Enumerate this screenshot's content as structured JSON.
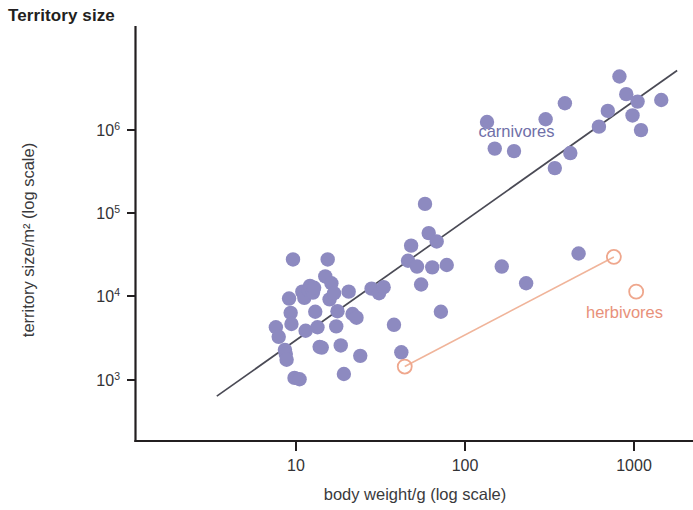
{
  "chart": {
    "title": "Territory size"
  },
  "chart_data": {
    "type": "scatter",
    "title": "Territory size",
    "xlabel": "body weight/g (log scale)",
    "ylabel": "territory size/m² (log scale)",
    "xscale": "log",
    "yscale": "log",
    "grid": false,
    "legend_position": "inline-annotations",
    "xlim": [
      2.6,
      2200
    ],
    "ylim": [
      450,
      7000000
    ],
    "xticks": [
      10,
      100,
      1000
    ],
    "xtick_labels": [
      "10",
      "100",
      "1000"
    ],
    "yticks": [
      1000,
      10000,
      100000,
      1000000
    ],
    "ytick_labels": [
      "10³",
      "10⁴",
      "10⁵",
      "10⁶"
    ],
    "ytick_mantissa": [
      "10",
      "10",
      "10",
      "10"
    ],
    "ytick_exponents": [
      "3",
      "4",
      "5",
      "6"
    ],
    "series": [
      {
        "name": "carnivores",
        "marker": "filled-circle",
        "color": "#8d8ac0",
        "label_color": "#6f6fa8",
        "label_x": 120,
        "label_y": 820000,
        "points": [
          [
            7.6,
            4300
          ],
          [
            7.9,
            3300
          ],
          [
            8.6,
            2300
          ],
          [
            8.7,
            2050
          ],
          [
            8.8,
            1750
          ],
          [
            9.1,
            9500
          ],
          [
            9.3,
            6400
          ],
          [
            9.4,
            4700
          ],
          [
            9.6,
            28000
          ],
          [
            9.8,
            1060
          ],
          [
            10.5,
            1020
          ],
          [
            10.9,
            11500
          ],
          [
            11.2,
            9700
          ],
          [
            11.4,
            3900
          ],
          [
            11.9,
            12000
          ],
          [
            12.1,
            13500
          ],
          [
            12.6,
            11200
          ],
          [
            12.8,
            12800
          ],
          [
            13.0,
            6600
          ],
          [
            13.4,
            4300
          ],
          [
            13.8,
            2500
          ],
          [
            14.2,
            2450
          ],
          [
            14.9,
            17500
          ],
          [
            15.4,
            28000
          ],
          [
            15.8,
            9300
          ],
          [
            16.2,
            14500
          ],
          [
            16.8,
            11000
          ],
          [
            17.3,
            4400
          ],
          [
            17.6,
            6700
          ],
          [
            18.4,
            2600
          ],
          [
            19.2,
            1180
          ],
          [
            20.5,
            11500
          ],
          [
            21.6,
            6200
          ],
          [
            22.8,
            5600
          ],
          [
            24.0,
            1950
          ],
          [
            28.0,
            12500
          ],
          [
            31.0,
            11000
          ],
          [
            33.0,
            13000
          ],
          [
            38.0,
            4600
          ],
          [
            42.0,
            2150
          ],
          [
            46.0,
            27000
          ],
          [
            48.0,
            41000
          ],
          [
            52.0,
            23000
          ],
          [
            55.0,
            14000
          ],
          [
            58.0,
            130000
          ],
          [
            61.0,
            58000
          ],
          [
            64.0,
            22500
          ],
          [
            68.0,
            46000
          ],
          [
            72.0,
            6600
          ],
          [
            78.0,
            24000
          ],
          [
            135.0,
            1250000
          ],
          [
            150.0,
            600000
          ],
          [
            165.0,
            23000
          ],
          [
            195.0,
            560000
          ],
          [
            230.0,
            14500
          ],
          [
            300.0,
            1350000
          ],
          [
            340.0,
            350000
          ],
          [
            390.0,
            2100000
          ],
          [
            420.0,
            530000
          ],
          [
            470.0,
            33000
          ],
          [
            620.0,
            1100000
          ],
          [
            700.0,
            1700000
          ],
          [
            820.0,
            4400000
          ],
          [
            900.0,
            2700000
          ],
          [
            980.0,
            1500000
          ],
          [
            1050.0,
            2200000
          ],
          [
            1100.0,
            1000000
          ],
          [
            1450.0,
            2300000
          ]
        ]
      },
      {
        "name": "herbivores",
        "marker": "open-circle",
        "color": "#efa78d",
        "label_color": "#e8917a",
        "label_x": 520,
        "label_y": 5600,
        "points": [
          [
            44.0,
            1450
          ],
          [
            760.0,
            30000
          ],
          [
            1030.0,
            11500
          ]
        ]
      }
    ],
    "trend_lines": [
      {
        "name": "carnivores-regression",
        "color": "#4a4a55",
        "x_start": 3.4,
        "y_start": 640,
        "x_end": 1800,
        "y_end": 5200000
      },
      {
        "name": "herbivores-regression",
        "color": "#f0b49a",
        "x_start": 44.0,
        "y_start": 1450,
        "x_end": 760.0,
        "y_end": 30000
      }
    ]
  }
}
